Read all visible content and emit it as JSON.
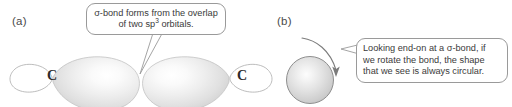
{
  "figure": {
    "panels": [
      {
        "letter": "(a)",
        "callout": {
          "line1": "σ-bond forms from the overlap",
          "line2_pre": "of two sp",
          "line2_sup": "3",
          "line2_post": " orbitals."
        },
        "atoms": [
          {
            "symbol": "C"
          },
          {
            "symbol": "C"
          }
        ]
      },
      {
        "letter": "(b)",
        "callout": {
          "line1": "Looking end-on at a σ-bond, if",
          "line2": "we rotate the bond, the shape",
          "line3": "that we see is always circular."
        }
      }
    ],
    "colors": {
      "background": "#ffffff",
      "callout_border": "#9a9a9a",
      "text": "#3a3a3a",
      "label": "#4a4a4a",
      "orbital_outline": "#b0b0b0",
      "orbital_fill_light": "#fefefe",
      "orbital_fill_mid": "#e8e8e8",
      "orbital_fill_dark": "#cfcfcf",
      "atom_text": "#2b2b2b",
      "arrow": "#6f6f6f"
    }
  }
}
